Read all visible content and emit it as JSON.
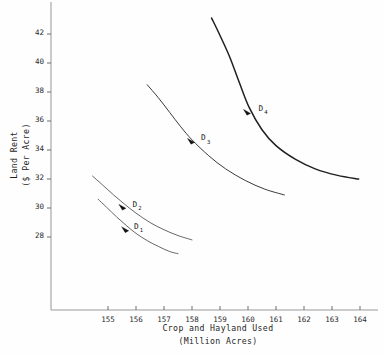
{
  "chart_data": {
    "type": "line",
    "title": "",
    "xlabel": "Crop and Hayland Used (Million Acres)",
    "xlabel_line1": "Crop and Hayland Used",
    "xlabel_line2": "(Million Acres)",
    "ylabel": "Land Rent ($ Per Acre)",
    "ylabel_line1": "Land Rent",
    "ylabel_line2": "($ Per Acre)",
    "xlim": [
      154.2,
      164.6
    ],
    "ylim": [
      26.6,
      43.2
    ],
    "grid": false,
    "legend": "none",
    "x_ticks": [
      "155",
      "156",
      "157",
      "158",
      "159",
      "160",
      "161",
      "162",
      "163",
      "164"
    ],
    "x_tick_values": [
      155,
      156,
      157,
      158,
      159,
      160,
      161,
      162,
      163,
      164
    ],
    "y_ticks": [
      "42",
      "40",
      "38",
      "36",
      "34",
      "32",
      "30",
      "28"
    ],
    "y_tick_values": [
      42,
      40,
      38,
      36,
      34,
      32,
      30,
      28
    ],
    "series": [
      {
        "name": "D1",
        "label": "D",
        "subscript": "1",
        "color": "#4a4a4a",
        "marker_point": [
          155.65,
          28.5
        ],
        "label_position": [
          155.8,
          28.7
        ],
        "points": [
          [
            154.65,
            30.6
          ],
          [
            154.95,
            30.05
          ],
          [
            155.3,
            29.4
          ],
          [
            155.65,
            28.8
          ],
          [
            156.0,
            28.25
          ],
          [
            156.4,
            27.75
          ],
          [
            156.8,
            27.35
          ],
          [
            157.2,
            27.0
          ],
          [
            157.5,
            26.85
          ]
        ]
      },
      {
        "name": "D2",
        "label": "D",
        "subscript": "2",
        "color": "#4a4a4a",
        "marker_point": [
          155.55,
          30.05
        ],
        "label_position": [
          155.75,
          30.2
        ],
        "points": [
          [
            154.45,
            32.2
          ],
          [
            154.8,
            31.6
          ],
          [
            155.2,
            30.9
          ],
          [
            155.6,
            30.25
          ],
          [
            156.0,
            29.65
          ],
          [
            156.5,
            29.0
          ],
          [
            157.0,
            28.5
          ],
          [
            157.5,
            28.1
          ],
          [
            158.0,
            27.8
          ]
        ]
      },
      {
        "name": "D3",
        "label": "D",
        "subscript": "3",
        "color": "#3a3a3a",
        "marker_point": [
          158.0,
          34.6
        ],
        "label_position": [
          158.2,
          34.8
        ],
        "points": [
          [
            156.4,
            38.5
          ],
          [
            156.8,
            37.6
          ],
          [
            157.2,
            36.6
          ],
          [
            157.6,
            35.6
          ],
          [
            158.0,
            34.7
          ],
          [
            158.6,
            33.6
          ],
          [
            159.2,
            32.7
          ],
          [
            159.9,
            31.9
          ],
          [
            160.6,
            31.3
          ],
          [
            161.3,
            30.9
          ]
        ]
      },
      {
        "name": "D4",
        "label": "D",
        "subscript": "4",
        "color": "#202020",
        "marker_point": [
          160.0,
          36.6
        ],
        "label_position": [
          160.25,
          36.85
        ],
        "points": [
          [
            158.7,
            43.1
          ],
          [
            159.0,
            41.9
          ],
          [
            159.35,
            40.4
          ],
          [
            159.7,
            38.6
          ],
          [
            160.05,
            36.9
          ],
          [
            160.5,
            35.4
          ],
          [
            161.0,
            34.3
          ],
          [
            161.7,
            33.35
          ],
          [
            162.4,
            32.7
          ],
          [
            163.2,
            32.25
          ],
          [
            163.95,
            32.0
          ]
        ]
      }
    ]
  }
}
